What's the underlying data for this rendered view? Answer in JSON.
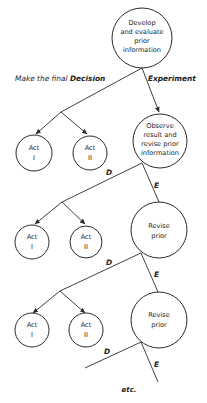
{
  "diagram": {
    "top_node": {
      "lines": [
        "Develop",
        "and evaluate",
        "prior",
        "information"
      ]
    },
    "decision_label_prefix": "Make the final ",
    "decision_label_bold": "Decision",
    "experiment_label": "Experiment",
    "stages": [
      {
        "node": {
          "lines": [
            "Observe",
            "result and",
            "revise prior",
            "information"
          ]
        },
        "acts": [
          {
            "lines": [
              "Act",
              "I"
            ]
          },
          {
            "lines": [
              "Act",
              "II"
            ]
          }
        ]
      },
      {
        "d_label": "D",
        "e_label": "E",
        "node": {
          "lines": [
            "Revise",
            "prior"
          ]
        },
        "acts": [
          {
            "lines": [
              "Act",
              "I"
            ]
          },
          {
            "lines": [
              "Act",
              "II"
            ]
          }
        ]
      },
      {
        "d_label": "D",
        "e_label": "E",
        "node": {
          "lines": [
            "Revise",
            "prior"
          ]
        },
        "acts": [
          {
            "lines": [
              "Act",
              "I"
            ]
          },
          {
            "lines": [
              "Act",
              "II"
            ]
          }
        ]
      }
    ],
    "final_d_label": "D",
    "final_e_label": "E",
    "continuation": "etc."
  }
}
